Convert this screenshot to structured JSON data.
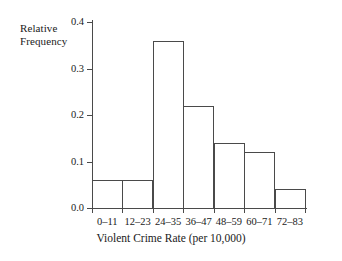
{
  "chart_data": {
    "type": "bar",
    "title": "",
    "subtitle": "",
    "xlabel": "Violent Crime Rate (per 10,000)",
    "ylabel": "Relative Frequency",
    "ylabel_line1": "Relative",
    "ylabel_line2": "Frequency",
    "categories": [
      "0–11",
      "12–23",
      "24–35",
      "36–47",
      "48–59",
      "60–71",
      "72–83"
    ],
    "values": [
      0.06,
      0.06,
      0.36,
      0.22,
      0.14,
      0.12,
      0.04
    ],
    "ylim": [
      0.0,
      0.4
    ],
    "yticks": [
      0.0,
      0.1,
      0.2,
      0.3,
      0.4
    ],
    "ytick_labels": [
      "0.0",
      "0.1",
      "0.2",
      "0.3",
      "0.4"
    ],
    "grid": false,
    "legend": null,
    "legend_position": "none",
    "bar_fill": "#ffffff",
    "bar_edge": "#4a4a4a",
    "axis_color": "#4a4a4a",
    "text_color": "#1a1a1a",
    "background": "#ffffff"
  }
}
